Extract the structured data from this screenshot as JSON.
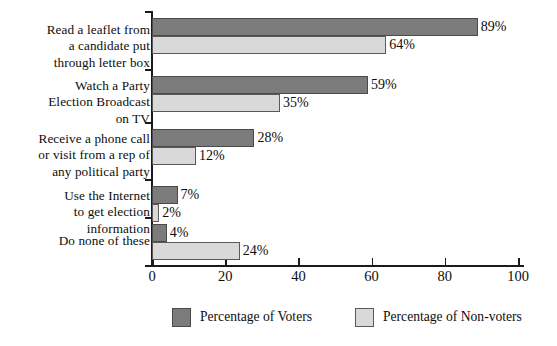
{
  "chart_data": {
    "type": "bar",
    "orientation": "horizontal",
    "title": "",
    "subtitle": "",
    "xlabel": "",
    "ylabel": "",
    "xlim": [
      0,
      100
    ],
    "xticks": [
      0,
      20,
      40,
      60,
      80,
      100
    ],
    "xtick_labels": [
      "0",
      "20",
      "40",
      "60",
      "80",
      "100"
    ],
    "grid": false,
    "legend_position": "bottom",
    "value_suffix": "%",
    "categories": [
      "Read a leaflet from\na candidate put\nthrough letter box",
      "Watch a Party\nElection Broadcast\non TV",
      "Receive a phone call\nor visit from a rep of\nany political party",
      "Use the Internet\nto get election\ninformation",
      "Do none of these"
    ],
    "series": [
      {
        "name": "Percentage of Voters",
        "color": "#7b7b7b",
        "values": [
          89,
          59,
          28,
          7,
          4
        ],
        "labels": [
          "89%",
          "59%",
          "28%",
          "7%",
          "4%"
        ]
      },
      {
        "name": "Percentage of Non-voters",
        "color": "#d9d9d9",
        "values": [
          64,
          35,
          12,
          2,
          24
        ],
        "labels": [
          "64%",
          "35%",
          "12%",
          "2%",
          "24%"
        ]
      }
    ]
  },
  "legend": {
    "items": [
      {
        "label": "Percentage of Voters",
        "color": "#7b7b7b"
      },
      {
        "label": "Percentage of Non-voters",
        "color": "#d9d9d9"
      }
    ]
  }
}
